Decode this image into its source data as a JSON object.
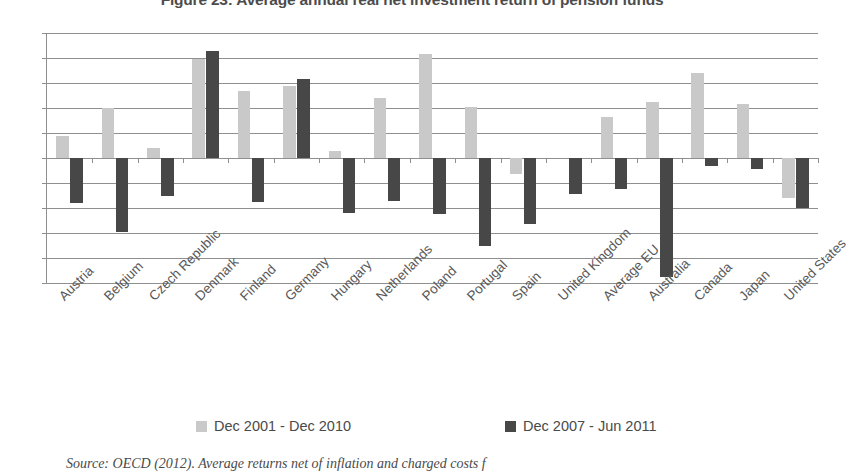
{
  "chart_data": {
    "type": "bar",
    "title": "Figure 23: Average annual real net investment return of pension funds",
    "xlabel": "",
    "ylabel": "",
    "ylim": [
      -5,
      5
    ],
    "ytick_labels": [
      "5%",
      "4%",
      "3%",
      "2%",
      "1%",
      "0%",
      "-1%",
      "-2%",
      "-3%",
      "-4%",
      "-5%"
    ],
    "ytick_values": [
      5,
      4,
      3,
      2,
      1,
      0,
      -1,
      -2,
      -3,
      -4,
      -5
    ],
    "grid": true,
    "legend_position": "bottom",
    "categories": [
      "Austria",
      "Belgium",
      "Czech Republic",
      "Denmark",
      "Finland",
      "Germany",
      "Hungary",
      "Netherlands",
      "Poland",
      "Portugal",
      "Spain",
      "United Kingdom",
      "Average EU",
      "Australia",
      "Canada",
      "Japan",
      "United States"
    ],
    "series": [
      {
        "name": "Dec 2001 - Dec 2010",
        "color": "#c9c9c9",
        "values": [
          0.9,
          2.0,
          0.4,
          3.95,
          2.7,
          2.9,
          0.3,
          2.4,
          4.15,
          2.05,
          -0.65,
          0.0,
          1.65,
          2.25,
          3.4,
          2.15,
          -1.6
        ]
      },
      {
        "name": "Dec 2007 - Jun 2011",
        "color": "#474747",
        "values": [
          -1.8,
          -2.95,
          -1.5,
          4.3,
          -1.75,
          3.15,
          -2.2,
          -1.7,
          -2.25,
          -3.5,
          -2.65,
          -1.45,
          -1.25,
          -4.75,
          -0.3,
          -0.45,
          -2.0
        ]
      }
    ],
    "source_note": "Source: OECD (2012). Average returns net of inflation and charged costs f"
  }
}
